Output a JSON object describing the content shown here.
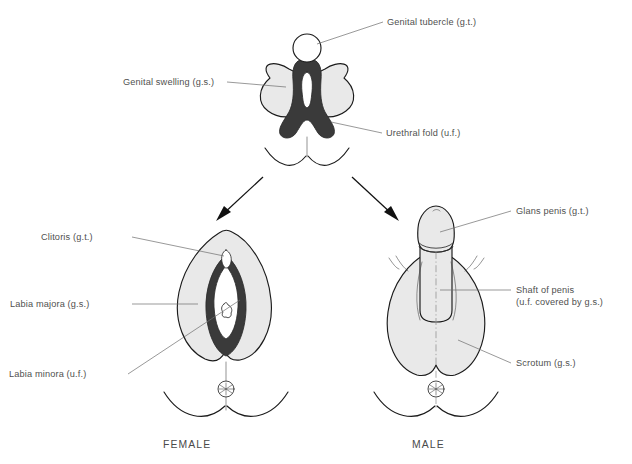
{
  "figure": {
    "background_color": "#ffffff",
    "line_color": "#1b1b1b",
    "label_color": "#50504f",
    "swelling_fill": "#e9e9e9",
    "urethral_fold_fill": "#3a3a3a"
  },
  "indifferent_stage": {
    "labels": {
      "genital_tubercle": "Genital tubercle (g.t.)",
      "genital_swelling": "Genital swelling (g.s.)",
      "urethral_fold": "Urethral fold (u.f.)"
    }
  },
  "female": {
    "caption": "FEMALE",
    "labels": {
      "clitoris": "Clitoris (g.t.)",
      "labia_majora": "Labia majora (g.s.)",
      "labia_minora": "Labia minora (u.f.)"
    }
  },
  "male": {
    "caption": "MALE",
    "labels": {
      "glans_penis": "Glans penis (g.t.)",
      "shaft_of_penis_line1": "Shaft of penis",
      "shaft_of_penis_line2": "(u.f. covered by g.s.)",
      "scrotum": "Scrotum (g.s.)"
    }
  },
  "arrows": {
    "to_female": "arrow-down-left",
    "to_male": "arrow-down-right"
  }
}
